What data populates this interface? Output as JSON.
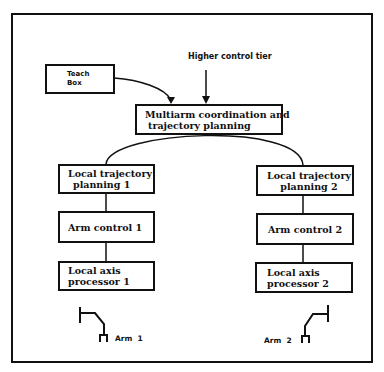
{
  "diagram": {
    "top_label": "Higher control tier",
    "teach_box": {
      "line1": "Teach",
      "line2": "Box"
    },
    "coordinator": {
      "line1": "Multiarm coordination and",
      "line2": "trajectory planning"
    },
    "left_branch": {
      "trajectory": {
        "line1": "Local trajectory",
        "line2": "planning 1"
      },
      "arm_control": {
        "line1": "Arm control 1"
      },
      "axis": {
        "line1": "Local axis",
        "line2": "processor 1"
      },
      "arm_label": "Arm  1",
      "arm_icon": "robot-arm-icon"
    },
    "right_branch": {
      "trajectory": {
        "line1": "Local trajectory",
        "line2": "planning 2"
      },
      "arm_control": {
        "line1": "Arm control 2"
      },
      "axis": {
        "line1": "Local axis",
        "line2": "processor 2"
      },
      "arm_label": "Arm  2",
      "arm_icon": "robot-arm-icon"
    },
    "colors": {
      "line": "#111111",
      "background": "#ffffff"
    }
  }
}
